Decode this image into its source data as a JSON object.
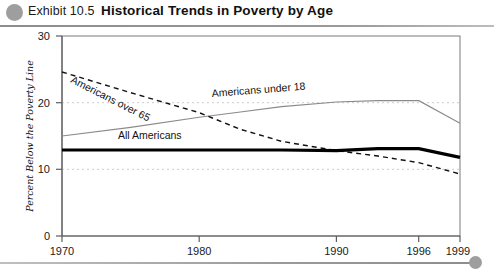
{
  "header": {
    "exhibit_label": "Exhibit 10.5",
    "title": "Historical Trends in Poverty by Age",
    "dot_color": "#9e9e9e",
    "rule_color": "#8d8d8d"
  },
  "chart_data": {
    "type": "line",
    "title": "Historical Trends in Poverty by Age",
    "xlabel": "Year",
    "ylabel": "Percent Below the Poverty Line",
    "xlim": [
      1970,
      1999
    ],
    "ylim": [
      0,
      30
    ],
    "yticks": [
      "0",
      "10",
      "20",
      "30"
    ],
    "ytick_values": [
      0,
      10,
      20,
      30
    ],
    "xticks": [
      "1970",
      "1980",
      "1990",
      "1996",
      "1999"
    ],
    "xtick_values": [
      1970,
      1980,
      1990,
      1996,
      1999
    ],
    "grid": "horizontal dotted at 10 and 20",
    "legend": "inline series labels on plot",
    "series": [
      {
        "name": "Americans over 65",
        "style": "dashed",
        "color": "#111111",
        "label_position": "along-line-upper-left",
        "x": [
          1970,
          1975,
          1980,
          1983,
          1986,
          1990,
          1993,
          1996,
          1999
        ],
        "values": [
          24.6,
          21.5,
          18.5,
          16.0,
          14.2,
          12.8,
          12.0,
          11.0,
          9.3
        ]
      },
      {
        "name": "Americans under 18",
        "style": "solid-thin",
        "color": "#8a8a8a",
        "label_position": "above-line-center",
        "x": [
          1970,
          1975,
          1980,
          1983,
          1986,
          1990,
          1993,
          1996,
          1999
        ],
        "values": [
          15.0,
          16.3,
          17.8,
          18.6,
          19.4,
          20.1,
          20.3,
          20.3,
          16.9
        ]
      },
      {
        "name": "All Americans",
        "style": "solid-thick",
        "color": "#000000",
        "label_position": "above-line-left",
        "x": [
          1970,
          1975,
          1980,
          1983,
          1986,
          1990,
          1993,
          1996,
          1999
        ],
        "values": [
          12.9,
          12.9,
          12.9,
          12.9,
          12.9,
          12.8,
          13.1,
          13.1,
          11.8
        ]
      }
    ]
  }
}
